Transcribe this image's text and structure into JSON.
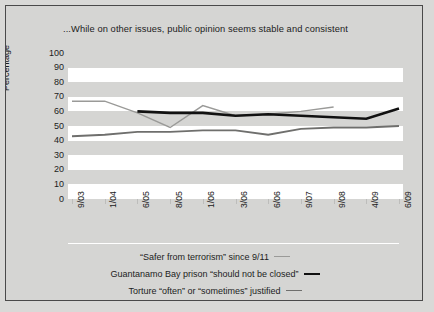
{
  "figure": {
    "title": "...While on other issues, public opinion seems stable and consistent",
    "background_color": "#d5d5d3",
    "band_color": "#ffffff",
    "border_color": "#4a4a4a"
  },
  "chart_data": {
    "type": "line",
    "title": "...While on other issues, public opinion seems stable and consistent",
    "xlabel": "",
    "ylabel": "Percentage",
    "ylim": [
      0,
      100
    ],
    "ytick_step": 10,
    "yticks": [
      100,
      90,
      80,
      70,
      60,
      50,
      40,
      30,
      20,
      10,
      0
    ],
    "grid": "horizontal-bands",
    "legend_position": "bottom",
    "categories": [
      "9/03",
      "1/04",
      "6/05",
      "8/05",
      "1/06",
      "3/06",
      "6/06",
      "9/07",
      "9/08",
      "4/09",
      "6/09"
    ],
    "series": [
      {
        "name": "“Safer from terrorism” since 9/11",
        "color": "#9a9a98",
        "width": 1.4,
        "values": [
          67,
          67,
          59,
          49,
          64,
          57,
          58,
          60,
          63,
          null,
          null
        ]
      },
      {
        "name": "Guantanamo Bay prison “should not be closed”",
        "color": "#111111",
        "width": 2.6,
        "values": [
          null,
          null,
          60,
          59,
          59,
          57,
          58,
          57,
          56,
          55,
          62
        ]
      },
      {
        "name": "Torture “often” or “sometimes” justified",
        "color": "#6f6f6d",
        "width": 1.9,
        "values": [
          43,
          44,
          46,
          46,
          47,
          47,
          44,
          48,
          49,
          49,
          50
        ]
      }
    ]
  },
  "legend": [
    {
      "label": "“Safer from terrorism” since 9/11",
      "swatch": "sw-light"
    },
    {
      "label": "Guantanamo Bay prison “should not be closed”",
      "swatch": "sw-black"
    },
    {
      "label": "Torture “often” or “sometimes” justified",
      "swatch": "sw-mid"
    }
  ]
}
